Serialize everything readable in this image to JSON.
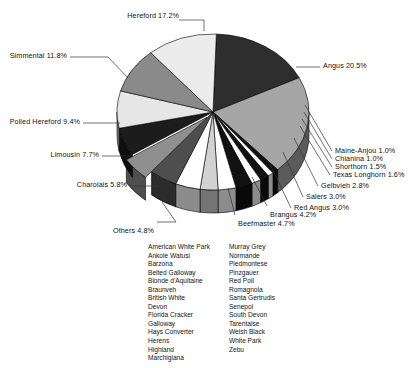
{
  "chart_data": {
    "type": "pie",
    "title": "",
    "subtitle": "",
    "xlabel": "",
    "ylabel": "",
    "legend_position": "callout-labels",
    "grid": false,
    "exploded_slices": [
      "Others"
    ],
    "style": "3d-pie-grayscale",
    "units": "percent",
    "categories": [
      "Hereford",
      "Angus",
      "Maine-Anjou",
      "Chianina",
      "Shorthorn",
      "Texas Longhorn",
      "Gelbvieh",
      "Salers",
      "Red Angus",
      "Brangus",
      "Beefmaster",
      "Others",
      "Charolais",
      "Limousin",
      "Polled Hereford",
      "Simmental"
    ],
    "values": [
      17.2,
      20.5,
      1.0,
      1.0,
      1.5,
      1.6,
      2.8,
      3.0,
      3.0,
      4.2,
      4.7,
      4.8,
      5.8,
      7.7,
      9.4,
      11.8
    ],
    "slices": [
      {
        "label": "Hereford",
        "value": 17.2,
        "label_text": "Hereford  17.2%",
        "fill": "#2e2e2e"
      },
      {
        "label": "Angus",
        "value": 20.5,
        "label_text": "Angus  20.5%",
        "fill": "#a6a6a6"
      },
      {
        "label": "Maine-Anjou",
        "value": 1.0,
        "label_text": "Maine-Anjou  1.0%",
        "fill": "#111111"
      },
      {
        "label": "Chianina",
        "value": 1.0,
        "label_text": "Chianina  1.0%",
        "fill": "#ffffff"
      },
      {
        "label": "Shorthorn",
        "value": 1.5,
        "label_text": "Shorthorn  1.5%",
        "fill": "#111111"
      },
      {
        "label": "Texas Longhorn",
        "value": 1.6,
        "label_text": "Texas Longhorn  1.6%",
        "fill": "#ffffff"
      },
      {
        "label": "Gelbvieh",
        "value": 2.8,
        "label_text": "Gelbvieh  2.8%",
        "fill": "#111111"
      },
      {
        "label": "Salers",
        "value": 3.0,
        "label_text": "Salers  3.0%",
        "fill": "#ffffff"
      },
      {
        "label": "Red Angus",
        "value": 3.0,
        "label_text": "Red Angus  3.0%",
        "fill": "#d2d2d2"
      },
      {
        "label": "Brangus",
        "value": 4.2,
        "label_text": "Brangus  4.2%",
        "fill": "#ffffff"
      },
      {
        "label": "Beefmaster",
        "value": 4.7,
        "label_text": "Beefmaster  4.7%",
        "fill": "#4e4e4e"
      },
      {
        "label": "Others",
        "value": 4.8,
        "label_text": "Others  4.8%",
        "fill": "#8f8f8f"
      },
      {
        "label": "Charolais",
        "value": 5.8,
        "label_text": "Charolais  5.8%",
        "fill": "#1c1c1c"
      },
      {
        "label": "Limousin",
        "value": 7.7,
        "label_text": "Limousin  7.7%",
        "fill": "#e6e6e6"
      },
      {
        "label": "Polled Hereford",
        "value": 9.4,
        "label_text": "Polled Hereford  9.4%",
        "fill": "#8a8a8a"
      },
      {
        "label": "Simmental",
        "value": 11.8,
        "label_text": "Simmental  11.8%",
        "fill": "#ececec"
      }
    ]
  },
  "labels": {
    "hereford": "Hereford  17.2%",
    "angus": "Angus  20.5%",
    "maine_anjou": "Maine-Anjou  1.0%",
    "chianina": "Chianina  1.0%",
    "shorthorn": "Shorthorn  1.5%",
    "texas_longhorn": "Texas Longhorn  1.6%",
    "gelbvieh": "Gelbvieh  2.8%",
    "salers": "Salers  3.0%",
    "red_angus": "Red Angus  3.0%",
    "brangus": "Brangus  4.2%",
    "beefmaster": "Beefmaster  4.7%",
    "others": "Others  4.8%",
    "charolais": "Charolais  5.8%",
    "limousin": "Limousin  7.7%",
    "polled_hereford": "Polled Hereford  9.4%",
    "simmental": "Simmental  11.8%"
  },
  "others_breeds": {
    "column_left": [
      "American White Park",
      "Ankole Watusi",
      "Barzona",
      "Belted Galloway",
      "Blonde d'Aquitaine",
      "Braunveh",
      "British White",
      "Devon",
      "Florida Cracker",
      "Galloway",
      "Hays Converter",
      "Herens",
      "Highland",
      "Marchigiana"
    ],
    "column_right": [
      "Murray Grey",
      "Normande",
      "Piedmontese",
      "Pinzgauer",
      "Red Poll",
      "Romagnola",
      "Santa Gertrudis",
      "Senepol",
      "South Devon",
      "Tarentaise",
      "Welsh Black",
      "White Park",
      "Zebu"
    ]
  },
  "colors": {
    "background": "#ffffff",
    "text": "#111111",
    "leader_line": "#333333",
    "slice_outline": "#000000"
  }
}
